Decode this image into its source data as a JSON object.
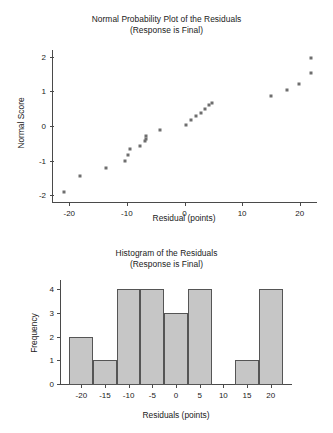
{
  "figures": [
    {
      "id": "normal-probability-plot",
      "title_line1": "Normal Probability Plot of the Residuals",
      "title_line2": "(Response is Final)"
    },
    {
      "id": "histogram",
      "title_line1": "Histogram of the Residuals",
      "title_line2": "(Response is Final)"
    }
  ],
  "chart_data": [
    {
      "type": "scatter",
      "title": "Normal Probability Plot of the Residuals (Response is Final)",
      "subtitle": "(Response is Final)",
      "xlabel": "Residual (points)",
      "ylabel": "Normal Score",
      "xlim": [
        -23,
        23
      ],
      "ylim": [
        -2.2,
        2.2
      ],
      "xticks": [
        -20,
        -10,
        0,
        10,
        20
      ],
      "xticklabels": [
        "-20",
        "-10",
        "0",
        "10",
        "20"
      ],
      "yticks": [
        -2,
        -1,
        0,
        1,
        2
      ],
      "yticklabels": [
        "-2",
        "-1",
        "0",
        "1",
        "2"
      ],
      "grid": false,
      "legend": false,
      "marker": "square",
      "marker_color": "#6e6e6e",
      "points": [
        {
          "x": -21.0,
          "y": -1.91
        },
        {
          "x": -18.2,
          "y": -1.45
        },
        {
          "x": -13.6,
          "y": -1.21
        },
        {
          "x": -10.4,
          "y": -1.02
        },
        {
          "x": -9.8,
          "y": -0.84
        },
        {
          "x": -9.4,
          "y": -0.68
        },
        {
          "x": -7.8,
          "y": -0.57
        },
        {
          "x": -6.9,
          "y": -0.44
        },
        {
          "x": -6.7,
          "y": -0.38
        },
        {
          "x": -6.6,
          "y": -0.3
        },
        {
          "x": -4.2,
          "y": -0.11
        },
        {
          "x": 0.2,
          "y": 0.02
        },
        {
          "x": 1.1,
          "y": 0.16
        },
        {
          "x": 2.0,
          "y": 0.28
        },
        {
          "x": 2.8,
          "y": 0.38
        },
        {
          "x": 3.5,
          "y": 0.48
        },
        {
          "x": 4.3,
          "y": 0.6
        },
        {
          "x": 4.7,
          "y": 0.68
        },
        {
          "x": 15.1,
          "y": 0.86
        },
        {
          "x": 17.8,
          "y": 1.04
        },
        {
          "x": 19.9,
          "y": 1.23
        },
        {
          "x": 21.9,
          "y": 1.54
        },
        {
          "x": 22.0,
          "y": 1.97
        }
      ]
    },
    {
      "type": "bar",
      "title": "Histogram of the Residuals (Response is Final)",
      "subtitle": "(Response is Final)",
      "xlabel": "Residuals (points)",
      "ylabel": "Frequency",
      "xlim": [
        -24.5,
        24.5
      ],
      "ylim": [
        0,
        4.4
      ],
      "xticks": [
        -20,
        -15,
        -10,
        -5,
        0,
        5,
        10,
        15,
        20
      ],
      "xticklabels": [
        "-20",
        "-15",
        "-10",
        "-5",
        "0",
        "5",
        "10",
        "15",
        "20"
      ],
      "yticks": [
        0,
        1,
        2,
        3,
        4
      ],
      "yticklabels": [
        "0",
        "1",
        "2",
        "3",
        "4"
      ],
      "grid": false,
      "legend": false,
      "bar_color": "#c6c6c6",
      "bar_edge_color": "#555555",
      "bin_width": 5,
      "bins": [
        {
          "start": -22.5,
          "end": -17.5,
          "value": 2
        },
        {
          "start": -17.5,
          "end": -12.5,
          "value": 1
        },
        {
          "start": -12.5,
          "end": -7.5,
          "value": 4
        },
        {
          "start": -7.5,
          "end": -2.5,
          "value": 4
        },
        {
          "start": -2.5,
          "end": 2.5,
          "value": 3
        },
        {
          "start": 2.5,
          "end": 7.5,
          "value": 4
        },
        {
          "start": 7.5,
          "end": 12.5,
          "value": 0
        },
        {
          "start": 12.5,
          "end": 17.5,
          "value": 1
        },
        {
          "start": 17.5,
          "end": 22.5,
          "value": 4
        }
      ]
    }
  ]
}
